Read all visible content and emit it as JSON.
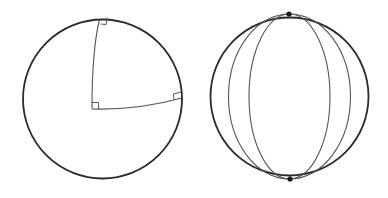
{
  "figure": {
    "left_sphere": {
      "label": "",
      "right_angle_markers": 3
    },
    "right_sphere": {
      "label": "",
      "meridian_count": 4,
      "pole_markers": 2
    },
    "colors": {
      "outline": "#2a2a2a",
      "arc": "#555555",
      "pole": "#1a1a1a",
      "background": "#ffffff"
    }
  }
}
